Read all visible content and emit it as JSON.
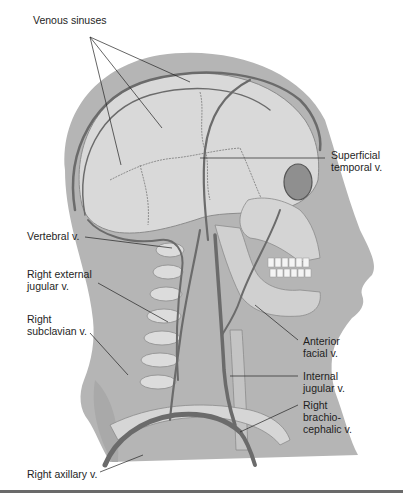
{
  "figure": {
    "colors": {
      "skin": "#b3b3b3",
      "bone": "#d8d8d8",
      "vein": "#6e6e6e",
      "line": "#222222",
      "rule": "#6a6a6a"
    },
    "labels": [
      {
        "id": "venous-sinuses",
        "text": "Venous sinuses",
        "x": 33,
        "y": 14
      },
      {
        "id": "superficial-temporal-v",
        "text": "Superficial\ntemporal v.",
        "x": 331,
        "y": 149
      },
      {
        "id": "vertebral-v",
        "text": "Vertebral v.",
        "x": 27,
        "y": 230
      },
      {
        "id": "right-external-jugular-v",
        "text": "Right external\njugular v.",
        "x": 27,
        "y": 268
      },
      {
        "id": "right-subclavian-v",
        "text": "Right\nsubclavian v.",
        "x": 27,
        "y": 313
      },
      {
        "id": "anterior-facial-v",
        "text": "Anterior\nfacial v.",
        "x": 303,
        "y": 335
      },
      {
        "id": "internal-jugular-v",
        "text": "Internal\njugular v.",
        "x": 303,
        "y": 370
      },
      {
        "id": "right-brachiocephalic-v",
        "text": "Right\nbrachio-\ncephalic v.",
        "x": 303,
        "y": 399
      },
      {
        "id": "right-axillary-v",
        "text": "Right axillary v.",
        "x": 27,
        "y": 468
      }
    ]
  }
}
